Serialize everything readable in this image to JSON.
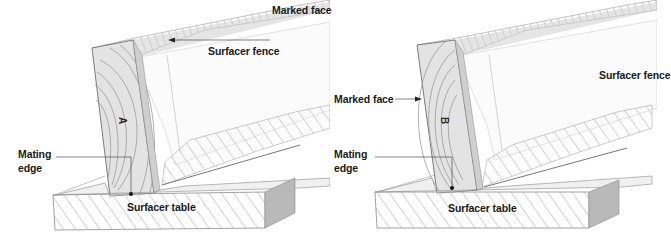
{
  "figure": {
    "colors": {
      "ink": "#1a1a1a",
      "pencil_dark": "#6e6e6e",
      "pencil_mid": "#a9a9a9",
      "pencil_light": "#d6d6d6",
      "wood_fill": "#e4e4e4",
      "background": "#ffffff"
    },
    "panels": [
      {
        "id": "left",
        "board_letter": "A",
        "labels": {
          "marked_face": "Marked face",
          "surfacer_fence": "Surfacer fence",
          "mating_edge_line1": "Mating",
          "mating_edge_line2": "edge",
          "surfacer_table": "Surfacer table"
        }
      },
      {
        "id": "right",
        "board_letter": "B",
        "labels": {
          "marked_face": "Marked face",
          "surfacer_fence": "Surfacer fence",
          "mating_edge_line1": "Mating",
          "mating_edge_line2": "edge",
          "surfacer_table": "Surfacer table"
        }
      }
    ]
  }
}
